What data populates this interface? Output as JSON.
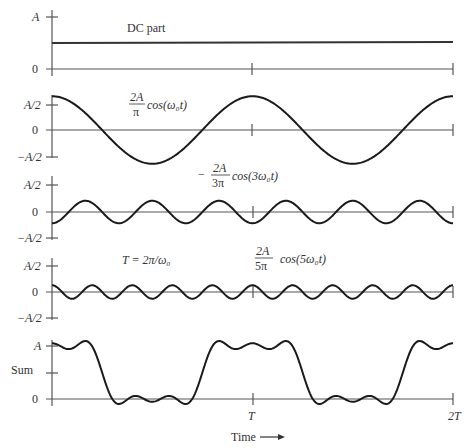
{
  "figure": {
    "time_label": "Time",
    "time_ticks": [
      "T",
      "2T"
    ],
    "panels": [
      {
        "name": "dc",
        "y_ticks": [
          "A",
          "0"
        ],
        "annotation": "DC part"
      },
      {
        "name": "fundamental",
        "y_ticks": [
          "A/2",
          "0",
          "−A/2"
        ],
        "annotation": {
          "coef_num": "2A",
          "coef_den": "π",
          "func": "cos(ω₀t)"
        }
      },
      {
        "name": "third_harmonic",
        "y_ticks": [
          "A/2",
          "0",
          "−A/2"
        ],
        "annotation": {
          "sign": "−",
          "coef_num": "2A",
          "coef_den": "3π",
          "func": "cos(3ω₀t)"
        }
      },
      {
        "name": "fifth_harmonic",
        "y_ticks": [
          "A/2",
          "0",
          "−A/2"
        ],
        "annotation": {
          "coef_num": "2A",
          "coef_den": "5π",
          "func": "cos(5ω₀t)"
        },
        "period_note": "T = 2π/ω₀"
      },
      {
        "name": "sum",
        "y_label": "Sum",
        "y_ticks": [
          "A",
          "0"
        ]
      }
    ]
  },
  "chart_data": {
    "type": "line",
    "xlabel": "Time",
    "x_ticks": [
      "0",
      "T",
      "2T"
    ],
    "xlim": [
      0,
      2
    ],
    "series": [
      {
        "name": "DC part",
        "formula": "A/2",
        "value": 0.5
      },
      {
        "name": "(2A/π) cos(ω₀t)",
        "amplitude": 0.637,
        "harmonic": 1
      },
      {
        "name": "−(2A/3π) cos(3ω₀t)",
        "amplitude": -0.212,
        "harmonic": 3
      },
      {
        "name": "(2A/5π) cos(5ω₀t)",
        "amplitude": 0.127,
        "harmonic": 5
      },
      {
        "name": "Sum",
        "description": "Approximate square wave between 0 and A, high near t=0, T, 2T; low near T/2, 3T/2"
      }
    ],
    "annotations": [
      "T = 2π/ω₀"
    ]
  }
}
